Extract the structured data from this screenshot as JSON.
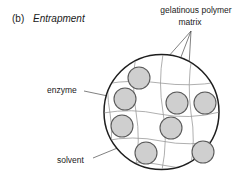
{
  "figure": {
    "panel_letter": "(b)",
    "title": "Entrapment"
  },
  "callouts": {
    "polymer_matrix_line1": "gelatinous polymer",
    "polymer_matrix_line2": "matrix",
    "enzyme": "enzyme",
    "solvent": "solvent"
  },
  "colors": {
    "ink": "#1a1a1a",
    "capsule_outline": "#1e1e1e",
    "mesh": "#9b9b9b",
    "enzyme_fill": "#cfcfcf",
    "enzyme_outline": "#5a5a5a",
    "leader": "#4a4a4a",
    "background": "#ffffff"
  },
  "diagram": {
    "type": "schematic",
    "capsule": {
      "cx": 161.5,
      "cy": 112,
      "r": 57.5
    },
    "enzymes": [
      {
        "cx": 139,
        "cy": 78,
        "r": 11
      },
      {
        "cx": 125,
        "cy": 99,
        "r": 11
      },
      {
        "cx": 177,
        "cy": 103,
        "r": 11
      },
      {
        "cx": 205,
        "cy": 103,
        "r": 11
      },
      {
        "cx": 122,
        "cy": 126,
        "r": 11
      },
      {
        "cx": 171,
        "cy": 128,
        "r": 11
      },
      {
        "cx": 146,
        "cy": 153,
        "r": 11
      },
      {
        "cx": 203,
        "cy": 152,
        "r": 11
      }
    ],
    "mesh_rows": 4,
    "mesh_cols": 4
  }
}
